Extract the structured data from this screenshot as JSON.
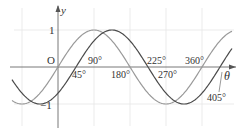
{
  "chart_data": {
    "type": "line",
    "title": "",
    "xlabel": "θ",
    "ylabel": "y",
    "origin_label": "O",
    "xlim_deg": [
      -115,
      435
    ],
    "ylim": [
      -1.2,
      1.2
    ],
    "grid": true,
    "grid_x_deg": [
      -90,
      90,
      180,
      270,
      360
    ],
    "grid_y": [
      1,
      -1
    ],
    "y_ticks": [
      {
        "value": 1,
        "label": "1"
      },
      {
        "value": -1,
        "label": "−1"
      }
    ],
    "x_tick_labels": [
      {
        "value": 45,
        "label": "45°",
        "position": "below"
      },
      {
        "value": 90,
        "label": "90°",
        "position": "above"
      },
      {
        "value": 180,
        "label": "180°",
        "position": "below"
      },
      {
        "value": 225,
        "label": "225°",
        "position": "above"
      },
      {
        "value": 270,
        "label": "270°",
        "position": "below"
      },
      {
        "value": 360,
        "label": "360°",
        "position": "above"
      },
      {
        "value": 405,
        "label": "405°",
        "position": "below-right-callout"
      }
    ],
    "series": [
      {
        "name": "y = sin θ",
        "color": "#9a9a9a",
        "zeros_deg": [
          0,
          180,
          360
        ],
        "amplitude": 1,
        "phase_shift_deg": 0
      },
      {
        "name": "y = sin(θ − 45°)",
        "color": "#4a4a4a",
        "zeros_deg": [
          45,
          225,
          405
        ],
        "amplitude": 1,
        "phase_shift_deg": 45
      }
    ]
  },
  "colors": {
    "axis": "#555555",
    "grid": "#e6e6e6",
    "curve_light": "#9a9a9a",
    "curve_dark": "#4a4a4a",
    "text": "#333333"
  }
}
